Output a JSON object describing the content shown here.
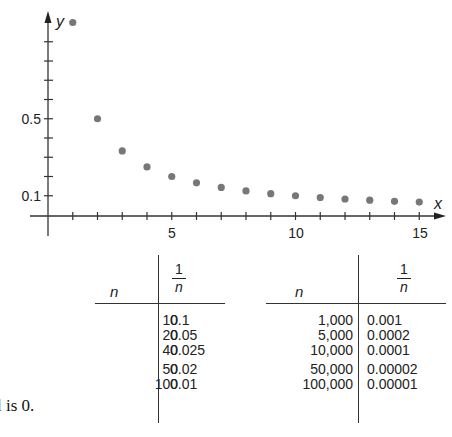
{
  "chart_data": {
    "type": "scatter",
    "title": "",
    "xlabel": "x",
    "ylabel": "y",
    "x_tick_labels": [
      "5",
      "10",
      "15"
    ],
    "y_tick_labels": [
      "0.1",
      "0.5"
    ],
    "xlim": [
      0,
      16
    ],
    "ylim": [
      0,
      1.05
    ],
    "grid": false,
    "series": [
      {
        "name": "1/n",
        "x": [
          1,
          2,
          3,
          4,
          5,
          6,
          7,
          8,
          9,
          10,
          11,
          12,
          13,
          14,
          15
        ],
        "values": [
          1.0,
          0.5,
          0.333,
          0.25,
          0.2,
          0.167,
          0.143,
          0.125,
          0.111,
          0.1,
          0.091,
          0.083,
          0.077,
          0.071,
          0.067
        ]
      }
    ],
    "color": "#777777"
  },
  "tables": [
    {
      "headers": {
        "n": "n",
        "frac_num": "1",
        "frac_den": "n"
      },
      "rows": [
        {
          "n": "10",
          "inv": "0.1"
        },
        {
          "n": "20",
          "inv": "0.05"
        },
        {
          "n": "40",
          "inv": "0.025"
        },
        {
          "n": "50",
          "inv": "0.02"
        },
        {
          "n": "100",
          "inv": "0.01"
        }
      ]
    },
    {
      "headers": {
        "n": "n",
        "frac_num": "1",
        "frac_den": "n"
      },
      "rows": [
        {
          "n": "1,000",
          "inv": "0.001"
        },
        {
          "n": "5,000",
          "inv": "0.0002"
        },
        {
          "n": "10,000",
          "inv": "0.0001"
        },
        {
          "n": "50,000",
          "inv": "0.00002"
        },
        {
          "n": "100,000",
          "inv": "0.00001"
        }
      ]
    }
  ],
  "caption": "l is 0."
}
